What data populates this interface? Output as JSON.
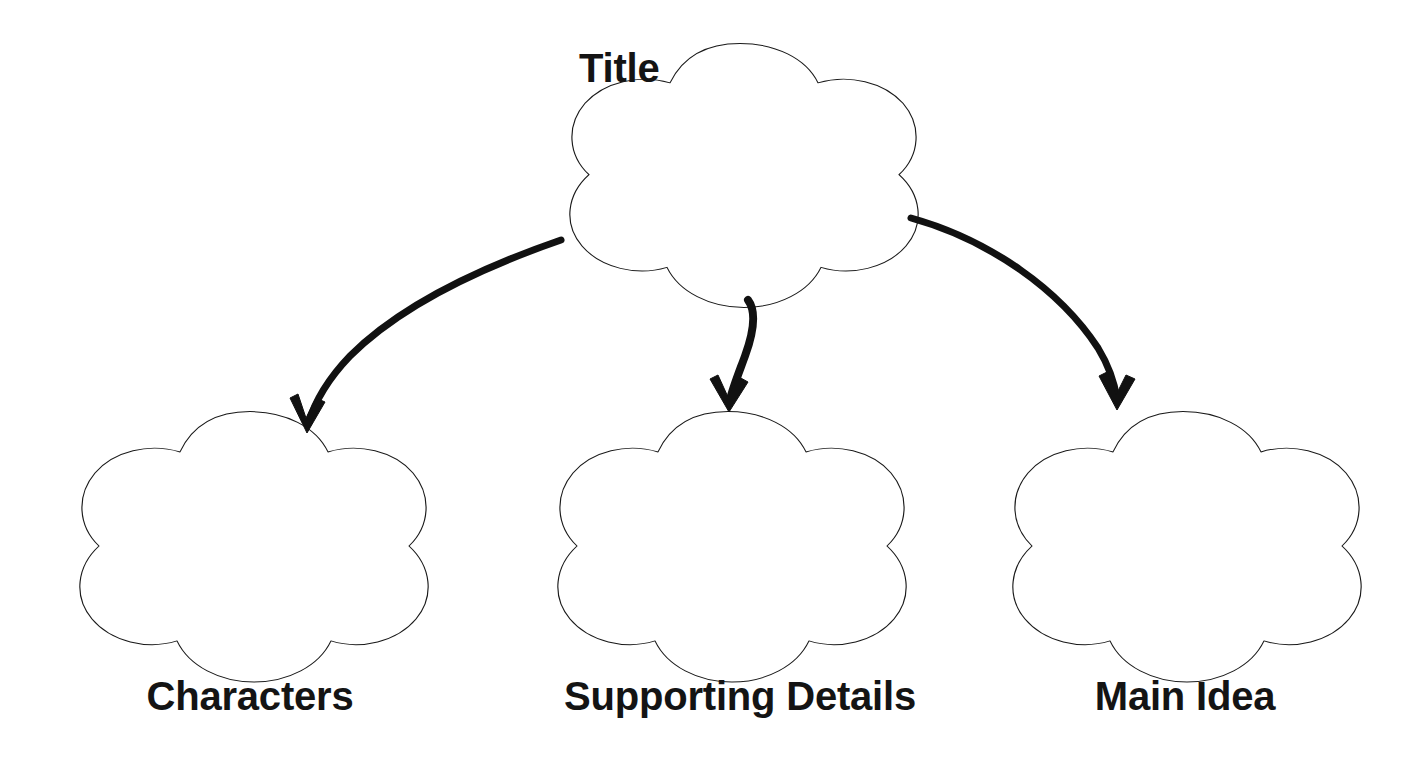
{
  "page": {
    "type": "graphic-organizer-worksheet",
    "background_color": "#ffffff",
    "width": 1424,
    "height": 758
  },
  "style": {
    "shape_outline_color": "#1a1a1a",
    "arrow_color": "#111111",
    "text_color": "#141414"
  },
  "nodes": {
    "title": {
      "label": "Title",
      "shape": "five-lobed-flower",
      "label_position": "top-left-outside"
    },
    "characters": {
      "label": "Characters",
      "shape": "five-lobed-flower",
      "label_position": "below"
    },
    "supporting_details": {
      "label": "Supporting Details",
      "shape": "five-lobed-flower",
      "label_position": "below"
    },
    "main_idea": {
      "label": "Main Idea",
      "shape": "five-lobed-flower",
      "label_position": "below"
    }
  },
  "connectors": [
    {
      "name": "title-to-characters",
      "from": "title",
      "to": "characters",
      "style": "curved-hand-drawn-arrow",
      "direction": "down-left"
    },
    {
      "name": "title-to-supporting-details",
      "from": "title",
      "to": "supporting_details",
      "style": "curved-hand-drawn-arrow",
      "direction": "down"
    },
    {
      "name": "title-to-main-idea",
      "from": "title",
      "to": "main_idea",
      "style": "curved-hand-drawn-arrow",
      "direction": "down-right"
    }
  ]
}
